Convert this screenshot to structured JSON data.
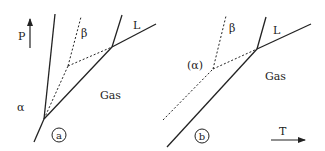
{
  "colors": {
    "line": "#222222",
    "background": "#ffffff"
  },
  "axes": {
    "p_label": "P",
    "t_label": "T"
  },
  "panels": [
    {
      "id": "a",
      "tag": "a",
      "labels": {
        "beta": "β",
        "liquid": "L",
        "gas": "Gas",
        "alpha": "α"
      }
    },
    {
      "id": "b",
      "tag": "b",
      "labels": {
        "beta": "β",
        "liquid": "L",
        "gas": "Gas",
        "alpha": "(α)"
      }
    }
  ]
}
